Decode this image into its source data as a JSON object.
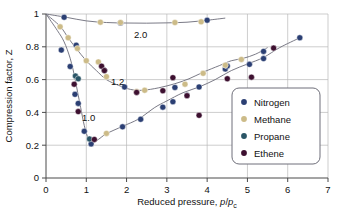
{
  "chart_data": {
    "type": "scatter",
    "title": "",
    "xlabel": "Reduced pressure, p/p_c",
    "ylabel": "Compression factor, Z",
    "xlim": [
      0,
      7
    ],
    "ylim": [
      0,
      1
    ],
    "xticks": [
      "0",
      "1",
      "2",
      "3",
      "4",
      "5",
      "6",
      "7"
    ],
    "yticks": [
      "0",
      "0.2",
      "0.4",
      "0.6",
      "0.8",
      "1"
    ],
    "grid": true,
    "legend_position": "lower-right",
    "curve_labels": [
      {
        "text": "2.0",
        "x": 2.35,
        "y": 0.855
      },
      {
        "text": "1.2",
        "x": 1.78,
        "y": 0.565
      },
      {
        "text": "1.0",
        "x": 1.06,
        "y": 0.345
      }
    ],
    "legend": [
      {
        "name": "Nitrogen",
        "color": "#2b3f73"
      },
      {
        "name": "Methane",
        "color": "#ccbb88"
      },
      {
        "name": "Propane",
        "color": "#2a5566"
      },
      {
        "name": "Ethene",
        "color": "#3d1030"
      }
    ],
    "isotherm_curves": [
      {
        "label": "1.0",
        "points": [
          [
            0.0,
            1.0
          ],
          [
            0.28,
            0.9
          ],
          [
            0.45,
            0.83
          ],
          [
            0.6,
            0.73
          ],
          [
            0.7,
            0.63
          ],
          [
            0.78,
            0.53
          ],
          [
            0.86,
            0.43
          ],
          [
            0.95,
            0.32
          ],
          [
            1.05,
            0.24
          ],
          [
            1.15,
            0.215
          ],
          [
            1.3,
            0.235
          ],
          [
            1.5,
            0.27
          ],
          [
            1.9,
            0.315
          ],
          [
            2.3,
            0.36
          ],
          [
            2.7,
            0.43
          ],
          [
            3.0,
            0.47
          ],
          [
            3.4,
            0.52
          ],
          [
            3.8,
            0.555
          ],
          [
            4.2,
            0.6
          ],
          [
            4.6,
            0.655
          ],
          [
            5.0,
            0.695
          ],
          [
            5.4,
            0.735
          ],
          [
            5.8,
            0.795
          ],
          [
            6.3,
            0.855
          ]
        ]
      },
      {
        "label": "1.2",
        "points": [
          [
            0.0,
            1.0
          ],
          [
            0.35,
            0.925
          ],
          [
            0.55,
            0.855
          ],
          [
            0.75,
            0.79
          ],
          [
            1.0,
            0.715
          ],
          [
            1.25,
            0.655
          ],
          [
            1.5,
            0.6
          ],
          [
            1.8,
            0.565
          ],
          [
            2.1,
            0.54
          ],
          [
            2.4,
            0.535
          ],
          [
            2.8,
            0.55
          ],
          [
            3.2,
            0.575
          ],
          [
            3.55,
            0.605
          ],
          [
            3.9,
            0.645
          ],
          [
            4.3,
            0.685
          ],
          [
            4.6,
            0.715
          ],
          [
            4.9,
            0.73
          ],
          [
            5.2,
            0.755
          ],
          [
            5.5,
            0.795
          ]
        ]
      },
      {
        "label": "2.0",
        "points": [
          [
            0.0,
            1.0
          ],
          [
            0.5,
            0.98
          ],
          [
            1.0,
            0.958
          ],
          [
            1.5,
            0.948
          ],
          [
            2.0,
            0.945
          ],
          [
            2.5,
            0.944
          ],
          [
            3.0,
            0.946
          ],
          [
            3.5,
            0.95
          ],
          [
            4.0,
            0.962
          ],
          [
            4.45,
            0.975
          ]
        ]
      }
    ],
    "series": [
      {
        "name": "Nitrogen",
        "color": "#2b3f73",
        "points": [
          [
            0.45,
            0.98
          ],
          [
            0.38,
            0.78
          ],
          [
            0.6,
            0.68
          ],
          [
            0.75,
            0.81
          ],
          [
            0.72,
            0.51
          ],
          [
            0.8,
            0.455
          ],
          [
            0.95,
            0.285
          ],
          [
            1.12,
            0.208
          ],
          [
            1.45,
            0.655
          ],
          [
            1.85,
            0.945
          ],
          [
            1.95,
            0.555
          ],
          [
            1.9,
            0.312
          ],
          [
            2.35,
            0.358
          ],
          [
            2.9,
            0.432
          ],
          [
            3.15,
            0.465
          ],
          [
            3.2,
            0.552
          ],
          [
            3.5,
            0.505
          ],
          [
            3.8,
            0.555
          ],
          [
            4.0,
            0.962
          ],
          [
            4.45,
            0.665
          ],
          [
            4.5,
            0.683
          ],
          [
            5.05,
            0.693
          ],
          [
            5.4,
            0.728
          ],
          [
            5.4,
            0.772
          ],
          [
            6.3,
            0.855
          ]
        ]
      },
      {
        "name": "Methane",
        "color": "#ccbb88",
        "points": [
          [
            0.35,
            0.922
          ],
          [
            0.55,
            0.855
          ],
          [
            0.78,
            0.79
          ],
          [
            1.0,
            0.715
          ],
          [
            1.3,
            0.708
          ],
          [
            1.5,
            0.618
          ],
          [
            1.35,
            0.95
          ],
          [
            1.85,
            0.948
          ],
          [
            2.25,
            0.528
          ],
          [
            2.45,
            0.535
          ],
          [
            3.2,
            0.948
          ],
          [
            3.45,
            0.572
          ],
          [
            3.85,
            0.952
          ],
          [
            3.9,
            0.638
          ],
          [
            4.45,
            0.688
          ],
          [
            4.85,
            0.723
          ],
          [
            1.5,
            0.272
          ]
        ]
      },
      {
        "name": "Propane",
        "color": "#2a5566",
        "points": [
          [
            0.73,
            0.622
          ],
          [
            0.8,
            0.605
          ],
          [
            1.08,
            0.238
          ]
        ]
      },
      {
        "name": "Ethene",
        "color": "#3d1030",
        "points": [
          [
            0.7,
            0.572
          ],
          [
            0.8,
            0.405
          ],
          [
            1.38,
            0.682
          ],
          [
            1.45,
            0.655
          ],
          [
            2.25,
            0.522
          ],
          [
            2.9,
            0.532
          ],
          [
            3.15,
            0.612
          ],
          [
            3.5,
            0.502
          ],
          [
            3.8,
            0.382
          ],
          [
            4.5,
            0.605
          ],
          [
            5.1,
            0.615
          ],
          [
            5.65,
            0.792
          ],
          [
            1.2,
            0.235
          ]
        ]
      }
    ]
  },
  "axis": {
    "x_label_prefix": "Reduced pressure, ",
    "x_label_p": "p",
    "x_label_slash": "/",
    "x_label_p2": "p",
    "x_label_sub": "c",
    "y_label": "Compression factor, Z"
  }
}
